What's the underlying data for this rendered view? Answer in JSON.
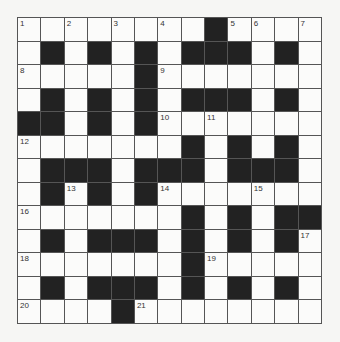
{
  "puzzle": {
    "rows": 13,
    "cols": 13,
    "colors": {
      "block": "#222222",
      "cell": "#fbfbfa",
      "border": "#555555",
      "background": "#f6f6f4"
    },
    "layout": [
      "WWWWWWWWBWWWW",
      "WBWBWBWBBBWBW",
      "WWWWWBWWWWWWW",
      "WBWBWBWBBBWBW",
      "BBWBWBWWWWWWW",
      "WWWWWWWBWBWBW",
      "WBBBWBBBWBBBW",
      "WBWBWBWWWWWWW",
      "WWWWWWWBWBWBB",
      "WBWBBBWBWBWBW",
      "WWWWWWWBWWWWW",
      "WBWBBBWBWBWBW",
      "WWWWBWWWWWWWW"
    ],
    "numbers": [
      {
        "row": 0,
        "col": 0,
        "n": "1"
      },
      {
        "row": 0,
        "col": 2,
        "n": "2"
      },
      {
        "row": 0,
        "col": 4,
        "n": "3"
      },
      {
        "row": 0,
        "col": 6,
        "n": "4"
      },
      {
        "row": 0,
        "col": 9,
        "n": "5"
      },
      {
        "row": 0,
        "col": 10,
        "n": "6"
      },
      {
        "row": 0,
        "col": 12,
        "n": "7"
      },
      {
        "row": 2,
        "col": 0,
        "n": "8"
      },
      {
        "row": 2,
        "col": 6,
        "n": "9"
      },
      {
        "row": 4,
        "col": 6,
        "n": "10"
      },
      {
        "row": 4,
        "col": 8,
        "n": "11"
      },
      {
        "row": 5,
        "col": 0,
        "n": "12"
      },
      {
        "row": 7,
        "col": 2,
        "n": "13"
      },
      {
        "row": 7,
        "col": 6,
        "n": "14"
      },
      {
        "row": 7,
        "col": 10,
        "n": "15"
      },
      {
        "row": 8,
        "col": 0,
        "n": "16"
      },
      {
        "row": 9,
        "col": 12,
        "n": "17"
      },
      {
        "row": 10,
        "col": 0,
        "n": "18"
      },
      {
        "row": 10,
        "col": 8,
        "n": "19"
      },
      {
        "row": 12,
        "col": 0,
        "n": "20"
      },
      {
        "row": 12,
        "col": 5,
        "n": "21"
      }
    ]
  }
}
